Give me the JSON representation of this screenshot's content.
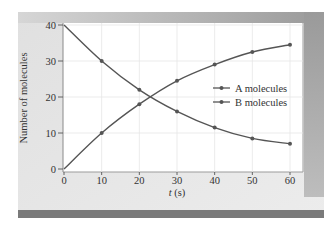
{
  "chart_data": {
    "type": "line",
    "title": "",
    "xlabel": "t (s)",
    "ylabel": "Number of molecules",
    "x": [
      0,
      10,
      20,
      30,
      40,
      50,
      60
    ],
    "xlim": [
      0,
      60
    ],
    "ylim": [
      0,
      40
    ],
    "xticks": [
      "0",
      "10",
      "20",
      "30",
      "40",
      "50",
      "60"
    ],
    "yticks": [
      "0",
      "10",
      "20",
      "30",
      "40"
    ],
    "grid": true,
    "legend_position": "center-right",
    "series": [
      {
        "name": "A molecules",
        "values": [
          40,
          30,
          22,
          16,
          11.5,
          8.5,
          7
        ],
        "markers": "circle"
      },
      {
        "name": "B molecules",
        "values": [
          0,
          10,
          18,
          24.5,
          29,
          32.5,
          34.5
        ],
        "markers": "circle"
      }
    ]
  },
  "colors": {
    "panel": "#e4e4e4",
    "panel_top_bar": "#b8b8b8",
    "panel_bottom_bar": "#7a7a7a",
    "panel_right_shadow": "#a8a8a8",
    "plot_bg": "#ffffff",
    "grid": "#e6e6e6",
    "line": "#555555",
    "text": "#333333"
  },
  "legend": {
    "a_label": "A molecules",
    "b_label": "B molecules"
  },
  "axes": {
    "x_title": "t (s)",
    "x_title_italic": "t",
    "x_title_unit": " (s)",
    "y_title": "Number of molecules"
  }
}
